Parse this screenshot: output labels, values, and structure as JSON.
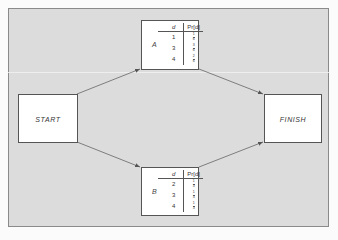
{
  "diagram": {
    "start": {
      "label": "START"
    },
    "finish": {
      "label": "FINISH"
    },
    "activities": [
      {
        "label": "A",
        "header": {
          "d": "d",
          "pr": "Pr[d]"
        },
        "rows": [
          {
            "d": "1",
            "num": "1",
            "den": "6"
          },
          {
            "d": "3",
            "num": "3",
            "den": "6"
          },
          {
            "d": "4",
            "num": "2",
            "den": "6"
          }
        ]
      },
      {
        "label": "B",
        "header": {
          "d": "d",
          "pr": "Pr[d]"
        },
        "rows": [
          {
            "d": "2",
            "num": "1",
            "den": "3"
          },
          {
            "d": "3",
            "num": "1",
            "den": "3"
          },
          {
            "d": "4",
            "num": "1",
            "den": "3"
          }
        ]
      }
    ],
    "edges": [
      {
        "from": "START",
        "to": "A"
      },
      {
        "from": "A",
        "to": "FINISH"
      },
      {
        "from": "START",
        "to": "B"
      },
      {
        "from": "B",
        "to": "FINISH"
      }
    ],
    "colors": {
      "background": "#dcdcdc",
      "box": "#ffffff",
      "line": "#555555"
    }
  }
}
